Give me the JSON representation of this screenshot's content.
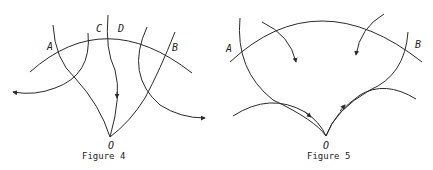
{
  "figures": [
    {
      "caption": "Figure 4",
      "labels": {
        "A": "A",
        "B": "B",
        "C": "C",
        "D": "D",
        "O": "O"
      }
    },
    {
      "caption": "Figure 5",
      "labels": {
        "A": "A",
        "B": "B",
        "O": "O"
      }
    }
  ],
  "colors": {
    "stroke": "#2a2a2a",
    "background": "#ffffff"
  }
}
